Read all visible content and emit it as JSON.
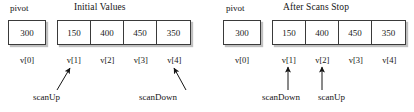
{
  "figure": {
    "type": "diagram"
  },
  "panels": [
    {
      "id": "initial",
      "title": "Initial Values",
      "pivot": {
        "label": "pivot",
        "value": "300",
        "index_label": "v[0]"
      },
      "array": {
        "values": [
          "150",
          "400",
          "450",
          "350"
        ],
        "index_labels": [
          "v[1]",
          "v[2]",
          "v[3]",
          "v[4]"
        ]
      },
      "annotations": [
        {
          "label": "scanUp",
          "points_to": "v[1]",
          "direction": "diagonal-up-right"
        },
        {
          "label": "scanDown",
          "points_to": "v[4]",
          "direction": "diagonal-up-left"
        }
      ]
    },
    {
      "id": "after",
      "title": "After Scans Stop",
      "pivot": {
        "label": "pivot",
        "value": "300",
        "index_label": "v[0]"
      },
      "array": {
        "values": [
          "150",
          "400",
          "450",
          "350"
        ],
        "index_labels": [
          "v[1]",
          "v[2]",
          "v[3]",
          "v[4]"
        ]
      },
      "annotations": [
        {
          "label": "scanDown",
          "points_to": "v[1]",
          "direction": "vertical-up"
        },
        {
          "label": "scanUp",
          "points_to": "v[2]",
          "direction": "vertical-up"
        }
      ]
    }
  ],
  "colors": {
    "background": "#ffffff",
    "box_border": "#3a3a3a",
    "text": "#1a1a1a",
    "shadow": "#8c8c8c"
  }
}
